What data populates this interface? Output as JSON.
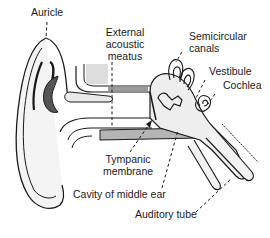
{
  "diagram": {
    "labels": {
      "auricle": "Auricle",
      "external_acoustic_meatus_1": "External",
      "external_acoustic_meatus_2": "acoustic",
      "external_acoustic_meatus_3": "meatus",
      "semicircular_canals_1": "Semicircular",
      "semicircular_canals_2": "canals",
      "vestibule": "Vestibule",
      "cochlea": "Cochlea",
      "tympanic_membrane_1": "Tympanic",
      "tympanic_membrane_2": "membrane",
      "cavity_of_middle_ear": "Cavity of middle ear",
      "auditory_tube": "Auditory tube"
    },
    "colors": {
      "line": "#1a1a1a",
      "fill_light": "#ececec",
      "fill_bone": "#d9d9d9",
      "background": "#ffffff"
    }
  }
}
